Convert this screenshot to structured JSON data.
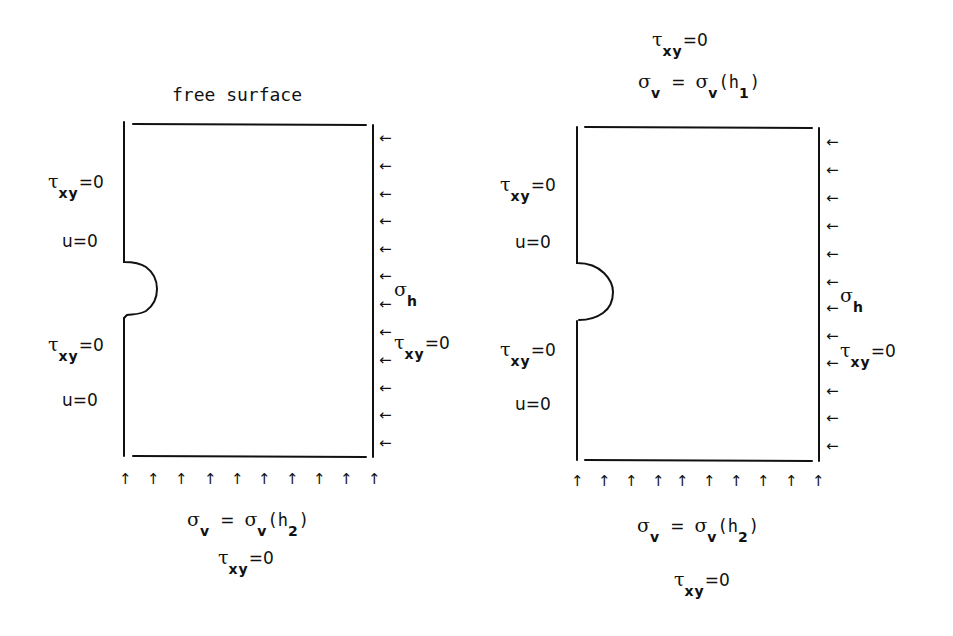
{
  "figure": {
    "left_panel": {
      "top_label": "free surface",
      "left_labels": [
        {
          "symbol": "τ",
          "subscript": "xy",
          "value": "=0"
        },
        {
          "text": "u=0"
        },
        {
          "symbol": "τ",
          "subscript": "xy",
          "value": "=0"
        },
        {
          "text": "u=0"
        }
      ],
      "right_labels": [
        {
          "symbol": "σ",
          "subscript": "h"
        },
        {
          "symbol": "τ",
          "subscript": "xy",
          "value": "=0"
        }
      ],
      "bottom_labels": {
        "line1": {
          "lhs_symbol": "σ",
          "lhs_sub": "v",
          "eq": "=",
          "rhs_symbol": "σ",
          "rhs_sub": "v",
          "arg_open": "(h",
          "arg_sub": "2",
          "arg_close": ")"
        },
        "line2": {
          "symbol": "τ",
          "subscript": "xy",
          "value": "=0"
        }
      },
      "right_arrow_count": 12,
      "bottom_arrow_count": 10
    },
    "right_panel": {
      "top_labels": {
        "line1": {
          "symbol": "τ",
          "subscript": "xy",
          "value": "=0"
        },
        "line2": {
          "lhs_symbol": "σ",
          "lhs_sub": "v",
          "eq": "=",
          "rhs_symbol": "σ",
          "rhs_sub": "v",
          "arg_open": "(h",
          "arg_sub": "1",
          "arg_close": ")"
        }
      },
      "left_labels": [
        {
          "symbol": "τ",
          "subscript": "xy",
          "value": "=0"
        },
        {
          "text": "u=0"
        },
        {
          "symbol": "τ",
          "subscript": "xy",
          "value": "=0"
        },
        {
          "text": "u=0"
        }
      ],
      "right_labels": [
        {
          "symbol": "σ",
          "subscript": "h"
        },
        {
          "symbol": "τ",
          "subscript": "xy",
          "value": "=0"
        }
      ],
      "bottom_labels": {
        "line1": {
          "lhs_symbol": "σ",
          "lhs_sub": "v",
          "eq": "=",
          "rhs_symbol": "σ",
          "rhs_sub": "v",
          "arg_open": "(h",
          "arg_sub": "2",
          "arg_close": ")"
        },
        "line2": {
          "symbol": "τ",
          "subscript": "xy",
          "value": "=0"
        }
      },
      "right_arrow_count": 12,
      "bottom_arrow_count": 10
    },
    "glyphs": {
      "left_arrow": "←",
      "up_arrow": "↑"
    },
    "colors": {
      "ink": "#111111",
      "background": "#ffffff"
    }
  }
}
